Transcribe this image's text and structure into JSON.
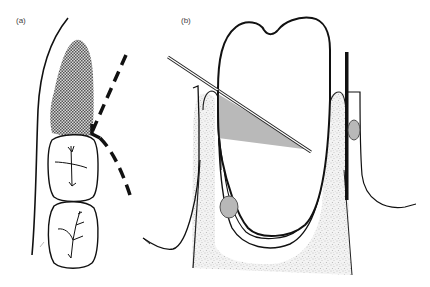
{
  "figure": {
    "panels": [
      {
        "label": "(a)",
        "description": "Occlusal view of teeth with shaded lesion region and dashed line"
      },
      {
        "label": "(b)",
        "description": "Cross-section of tooth in bone with probe and gray shaded triangle"
      }
    ]
  },
  "colors": {
    "stroke": "#111111",
    "shade_gray": "#b8b8b8",
    "stipple_bg": "#f2f2f2",
    "stipple_dot": "#9a9a9a",
    "crosshatch": "#6b6b6b"
  }
}
